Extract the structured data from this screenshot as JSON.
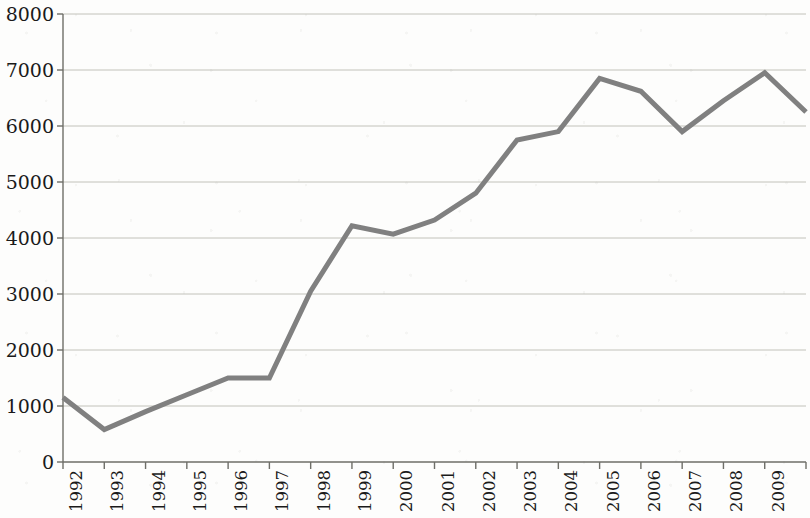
{
  "chart_data": {
    "type": "line",
    "title": "",
    "subtitle": "",
    "xlabel": "",
    "ylabel": "",
    "categories": [
      "1992",
      "1993",
      "1994",
      "1995",
      "1996",
      "1997",
      "1998",
      "1999",
      "2000",
      "2001",
      "2002",
      "2003",
      "2004",
      "2005",
      "2006",
      "2007",
      "2008",
      "2009",
      "2010"
    ],
    "series": [
      {
        "name": "series-1",
        "values": [
          1150,
          580,
          900,
          1200,
          1500,
          1500,
          3050,
          4220,
          4070,
          4320,
          4800,
          5750,
          5900,
          6850,
          6620,
          5900,
          6450,
          6950,
          6250
        ],
        "color": "#808080"
      }
    ],
    "ylim": [
      0,
      8000
    ],
    "ytick_labels": [
      "8000",
      "7000",
      "6000",
      "5000",
      "4000",
      "3000",
      "2000",
      "1000",
      "0"
    ],
    "ytick_values": [
      8000,
      7000,
      6000,
      5000,
      4000,
      3000,
      2000,
      1000,
      0
    ],
    "grid": true,
    "grid_axis": "y",
    "grid_color": "#b8b8b0",
    "axis_color": "#6e6e68",
    "legend": false,
    "legend_position": "none",
    "annotations": [],
    "xtick_rotation": -90,
    "background_color": "#fdfdfc",
    "line_width": 5
  }
}
